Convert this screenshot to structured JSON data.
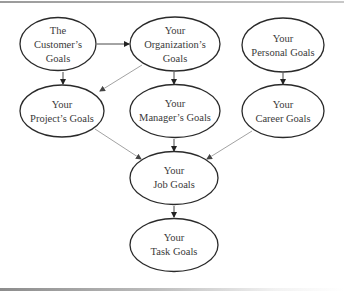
{
  "diagram": {
    "nodes": {
      "customer": {
        "line1": "The",
        "line2": "Customer’s",
        "line3": "Goals"
      },
      "organization": {
        "line1": "Your",
        "line2": "Organization’s",
        "line3": "Goals"
      },
      "personal": {
        "line1": "Your",
        "line2": "Personal Goals"
      },
      "project": {
        "line1": "Your",
        "line2": "Project’s Goals"
      },
      "manager": {
        "line1": "Your",
        "line2": "Manager’s Goals"
      },
      "career": {
        "line1": "Your",
        "line2": "Career Goals"
      },
      "job": {
        "line1": "Your",
        "line2": "Job Goals"
      },
      "task": {
        "line1": "Your",
        "line2": "Task Goals"
      }
    },
    "edges": [
      {
        "from": "customer",
        "to": "organization"
      },
      {
        "from": "customer",
        "to": "project"
      },
      {
        "from": "organization",
        "to": "project"
      },
      {
        "from": "organization",
        "to": "manager"
      },
      {
        "from": "personal",
        "to": "career"
      },
      {
        "from": "project",
        "to": "job"
      },
      {
        "from": "manager",
        "to": "job"
      },
      {
        "from": "career",
        "to": "job"
      },
      {
        "from": "job",
        "to": "task"
      }
    ]
  }
}
